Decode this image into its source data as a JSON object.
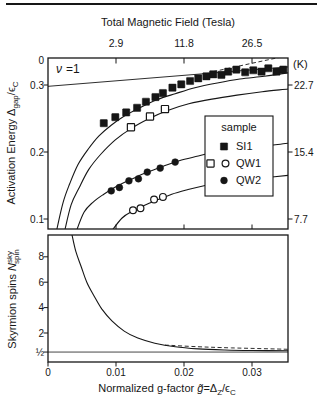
{
  "page": {
    "ink": "#161616",
    "background": "#ffffff"
  },
  "chart_data": [
    {
      "id": "activation-energy-panel",
      "type": "scatter",
      "top_axis": {
        "title": "Total Magnetic Field (Tesla)",
        "ticks": [
          {
            "label": "2.9",
            "g": 0.01
          },
          {
            "label": "11.8",
            "g": 0.02
          },
          {
            "label": "26.5",
            "g": 0.03
          }
        ]
      },
      "left_axis": {
        "title_parts": [
          {
            "t": "Activation Energy "
          },
          {
            "t": "Δ"
          },
          {
            "t": "gap",
            "pos": "sub"
          },
          {
            "t": "/ϵ"
          },
          {
            "t": "C",
            "pos": "sub"
          }
        ],
        "ticks": [
          {
            "label": "0",
            "v": 0.337
          },
          {
            "label": "0.3",
            "v": 0.3
          },
          {
            "label": "0.2",
            "v": 0.2
          },
          {
            "label": "0.1",
            "v": 0.1
          }
        ]
      },
      "right_axis": {
        "unit": "(K)",
        "ticks": [
          {
            "label": "22.7",
            "v": 0.3
          },
          {
            "label": "15.4",
            "v": 0.2
          },
          {
            "label": "7.7",
            "v": 0.1
          }
        ]
      },
      "xlim": [
        0,
        0.0353
      ],
      "ylim": [
        0.085,
        0.34
      ],
      "annotation": {
        "nu": "ν",
        "eq": "=1"
      },
      "series": [
        {
          "name": "SI1",
          "marker": "filled-square",
          "points": [
            [
              0.0082,
              0.243
            ],
            [
              0.0099,
              0.252
            ],
            [
              0.0115,
              0.259
            ],
            [
              0.0131,
              0.266
            ],
            [
              0.0144,
              0.275
            ],
            [
              0.0158,
              0.282
            ],
            [
              0.0169,
              0.288
            ],
            [
              0.0183,
              0.296
            ],
            [
              0.0196,
              0.301
            ],
            [
              0.0209,
              0.306
            ],
            [
              0.0221,
              0.31
            ],
            [
              0.0233,
              0.313
            ],
            [
              0.0243,
              0.316
            ],
            [
              0.0255,
              0.315
            ],
            [
              0.0265,
              0.32
            ],
            [
              0.0277,
              0.323
            ],
            [
              0.029,
              0.319
            ],
            [
              0.0302,
              0.322
            ],
            [
              0.0314,
              0.32
            ],
            [
              0.0324,
              0.325
            ],
            [
              0.0336,
              0.32
            ],
            [
              0.0346,
              0.323
            ]
          ]
        },
        {
          "name": "QW1",
          "marker": "open-square",
          "points": [
            [
              0.0122,
              0.237
            ],
            [
              0.015,
              0.253
            ],
            [
              0.0172,
              0.264
            ]
          ]
        },
        {
          "name": "QW1",
          "marker": "open-circle",
          "points": [
            [
              0.0125,
              0.113
            ],
            [
              0.0136,
              0.116
            ],
            [
              0.0156,
              0.129
            ],
            [
              0.0169,
              0.133
            ]
          ]
        },
        {
          "name": "QW2",
          "marker": "filled-circle",
          "points": [
            [
              0.0093,
              0.142
            ],
            [
              0.0105,
              0.147
            ],
            [
              0.0119,
              0.157
            ],
            [
              0.0133,
              0.16
            ],
            [
              0.0146,
              0.17
            ],
            [
              0.0165,
              0.176
            ],
            [
              0.0187,
              0.185
            ]
          ]
        }
      ],
      "curves": [
        {
          "name": "single-spin-flip-line",
          "dash": false,
          "width": 0.9,
          "points": [
            [
              0,
              0.298
            ],
            [
              0.0353,
              0.327
            ]
          ]
        },
        {
          "name": "dashed-extension",
          "dash": true,
          "width": 0.9,
          "points": [
            [
              0.0243,
              0.32
            ],
            [
              0.0353,
              0.344
            ]
          ]
        },
        {
          "name": "si1-theory-curve",
          "dash": false,
          "width": 1.1,
          "points": [
            [
              0.0012,
              0.08
            ],
            [
              0.0022,
              0.124
            ],
            [
              0.0032,
              0.153
            ],
            [
              0.0044,
              0.181
            ],
            [
              0.0059,
              0.204
            ],
            [
              0.0075,
              0.224
            ],
            [
              0.0093,
              0.24
            ],
            [
              0.0113,
              0.254
            ],
            [
              0.0135,
              0.266
            ],
            [
              0.016,
              0.278
            ],
            [
              0.0187,
              0.287
            ],
            [
              0.0216,
              0.296
            ],
            [
              0.0249,
              0.303
            ],
            [
              0.0282,
              0.309
            ],
            [
              0.0318,
              0.313
            ],
            [
              0.0353,
              0.318
            ]
          ]
        },
        {
          "name": "qw1-theory-curve",
          "dash": false,
          "width": 1.1,
          "points": [
            [
              0.0024,
              0.08
            ],
            [
              0.0034,
              0.121
            ],
            [
              0.0046,
              0.147
            ],
            [
              0.006,
              0.174
            ],
            [
              0.0078,
              0.197
            ],
            [
              0.0099,
              0.218
            ],
            [
              0.0122,
              0.235
            ],
            [
              0.0149,
              0.25
            ],
            [
              0.0176,
              0.262
            ],
            [
              0.0207,
              0.272
            ],
            [
              0.0241,
              0.279
            ],
            [
              0.0278,
              0.285
            ],
            [
              0.0315,
              0.29
            ],
            [
              0.0353,
              0.294
            ]
          ]
        },
        {
          "name": "qw2-theory-curve",
          "dash": false,
          "width": 1.1,
          "points": [
            [
              0.0041,
              0.08
            ],
            [
              0.0053,
              0.11
            ],
            [
              0.0066,
              0.125
            ],
            [
              0.0082,
              0.137
            ],
            [
              0.0101,
              0.149
            ],
            [
              0.0122,
              0.159
            ],
            [
              0.0144,
              0.169
            ],
            [
              0.0168,
              0.178
            ],
            [
              0.0193,
              0.187
            ],
            [
              0.0221,
              0.194
            ],
            [
              0.0251,
              0.2015
            ],
            [
              0.0285,
              0.206
            ],
            [
              0.0319,
              0.209
            ],
            [
              0.0353,
              0.213
            ]
          ]
        },
        {
          "name": "qw1-lower-theory-curve",
          "dash": false,
          "width": 1.1,
          "points": [
            [
              0.0092,
              0.08
            ],
            [
              0.0109,
              0.1015
            ],
            [
              0.0125,
              0.112
            ],
            [
              0.0143,
              0.121
            ],
            [
              0.0162,
              0.129
            ],
            [
              0.0182,
              0.137
            ],
            [
              0.0206,
              0.144
            ],
            [
              0.0231,
              0.15
            ],
            [
              0.0259,
              0.156
            ],
            [
              0.029,
              0.159
            ],
            [
              0.0321,
              0.162
            ],
            [
              0.0353,
              0.165
            ]
          ]
        }
      ],
      "legend": {
        "title": "sample",
        "entries": [
          {
            "label": "SI1",
            "markers": [
              "filled-square"
            ]
          },
          {
            "label": "QW1",
            "markers": [
              "open-square",
              "open-circle"
            ]
          },
          {
            "label": "QW2",
            "markers": [
              "filled-circle"
            ]
          }
        ]
      }
    },
    {
      "id": "skyrmion-spins-panel",
      "type": "line",
      "left_axis": {
        "title_parts": [
          {
            "t": "Skyrmion spins "
          },
          {
            "t": "N",
            "it": true
          },
          {
            "t": "sky",
            "pos": "sup"
          },
          {
            "t": "spin",
            "pos": "sub",
            "dx": -13
          }
        ],
        "ticks": [
          {
            "label": "8",
            "n": 8
          },
          {
            "label": "6",
            "n": 6
          },
          {
            "label": "4",
            "n": 4
          },
          {
            "label": "2",
            "n": 2
          },
          {
            "label": "½",
            "n": 0.5
          }
        ]
      },
      "bottom_axis": {
        "title_parts": [
          {
            "t": "Normalized g-factor "
          },
          {
            "t": "g̃",
            "it": true
          },
          {
            "t": "=Δ"
          },
          {
            "t": "Z",
            "pos": "sub"
          },
          {
            "t": "/ϵ"
          },
          {
            "t": "C",
            "pos": "sub"
          }
        ],
        "ticks": [
          {
            "label": "0",
            "g": 0
          },
          {
            "label": "0.01",
            "g": 0.01
          },
          {
            "label": "0.02",
            "g": 0.02
          },
          {
            "label": "0.03",
            "g": 0.03
          }
        ]
      },
      "xlim": [
        0,
        0.0353
      ],
      "ylim": [
        -0.28,
        9.8
      ],
      "curves": [
        {
          "name": "skyrmion-size-curve",
          "dash": false,
          "width": 1.1,
          "points": [
            [
              0.0035,
              9.8
            ],
            [
              0.0041,
              8.4
            ],
            [
              0.0049,
              7.2
            ],
            [
              0.0057,
              6.0
            ],
            [
              0.0068,
              4.9
            ],
            [
              0.0079,
              3.9
            ],
            [
              0.0094,
              2.95
            ],
            [
              0.0112,
              2.15
            ],
            [
              0.0132,
              1.6
            ],
            [
              0.0157,
              1.2
            ],
            [
              0.0187,
              0.92
            ],
            [
              0.0221,
              0.75
            ],
            [
              0.026,
              0.66
            ],
            [
              0.03,
              0.62
            ],
            [
              0.0353,
              0.6
            ]
          ]
        },
        {
          "name": "dashed-asymptote",
          "dash": true,
          "width": 0.9,
          "points": [
            [
              0.0172,
              1.05
            ],
            [
              0.022,
              0.92
            ],
            [
              0.027,
              0.83
            ],
            [
              0.0353,
              0.72
            ]
          ]
        },
        {
          "name": "half-spin-reference-line",
          "dash": false,
          "width": 0.8,
          "points": [
            [
              0,
              0.5
            ],
            [
              0.0353,
              0.5
            ]
          ]
        }
      ]
    }
  ]
}
